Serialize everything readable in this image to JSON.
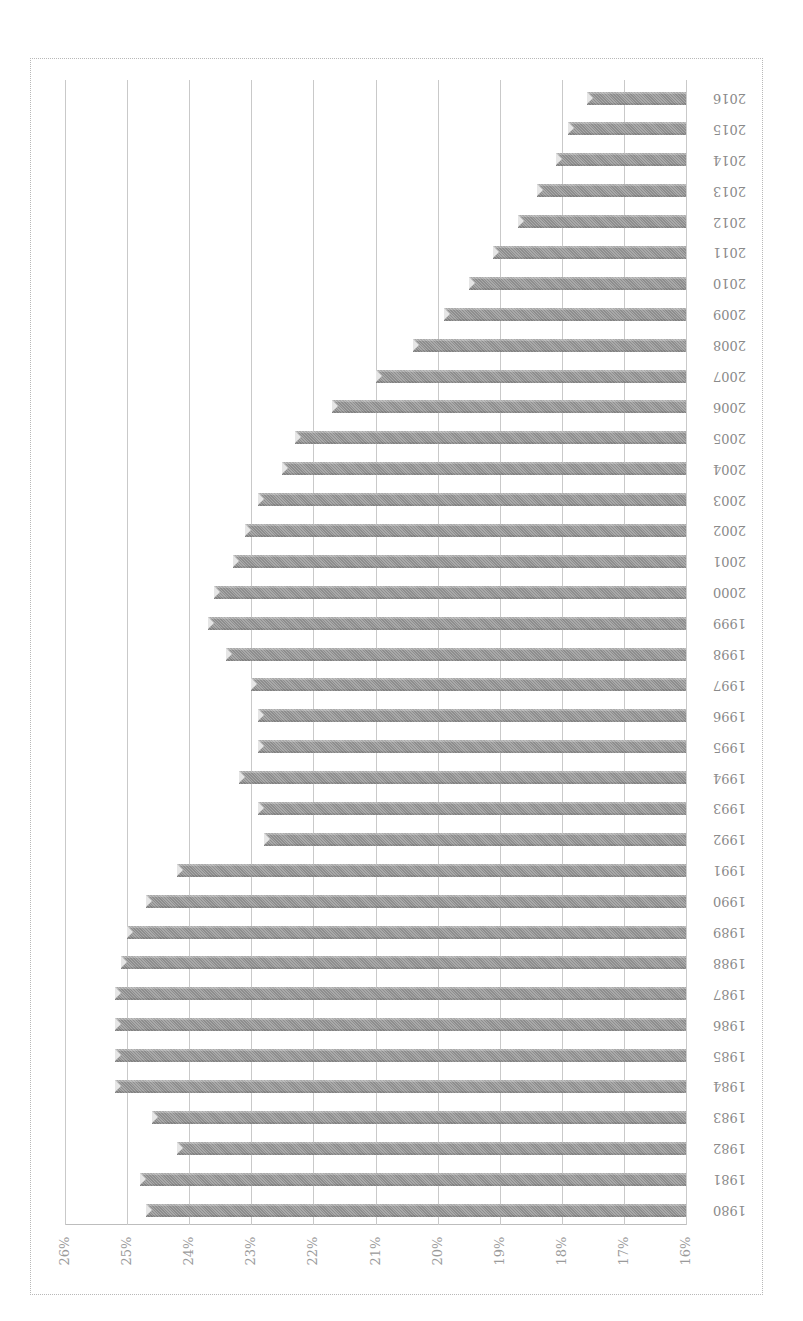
{
  "chart_data": {
    "type": "bar",
    "orientation": "horizontal (image rotated 90°, bars extend from 16% baseline)",
    "title": "",
    "xlabel": "",
    "ylabel": "",
    "categories": [
      "1980",
      "1981",
      "1982",
      "1983",
      "1984",
      "1985",
      "1986",
      "1987",
      "1988",
      "1989",
      "1990",
      "1991",
      "1992",
      "1993",
      "1994",
      "1995",
      "1996",
      "1997",
      "1998",
      "1999",
      "2000",
      "2001",
      "2002",
      "2003",
      "2004",
      "2005",
      "2006",
      "2007",
      "2008",
      "2009",
      "2010",
      "2011",
      "2012",
      "2013",
      "2014",
      "2015",
      "2016"
    ],
    "values": [
      24.7,
      24.8,
      24.2,
      24.6,
      25.2,
      25.2,
      25.2,
      25.2,
      25.1,
      25.0,
      24.7,
      24.2,
      22.8,
      22.9,
      23.2,
      22.9,
      22.9,
      23.0,
      23.4,
      23.7,
      23.6,
      23.3,
      23.1,
      22.9,
      22.5,
      22.3,
      21.7,
      21.0,
      20.4,
      19.9,
      19.5,
      19.1,
      18.7,
      18.4,
      18.1,
      17.9,
      17.6
    ],
    "value_unit": "%",
    "ylim": [
      16,
      26
    ],
    "tick_labels": [
      "16%",
      "17%",
      "18%",
      "19%",
      "20%",
      "21%",
      "22%",
      "23%",
      "24%",
      "25%",
      "26%"
    ],
    "grid": true,
    "legend": null,
    "bar_color": "#9b9b9b"
  }
}
